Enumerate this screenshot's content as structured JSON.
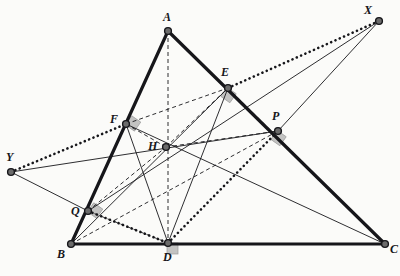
{
  "figure": {
    "background_color": "#fbfbf9",
    "stroke_color": "#16161a",
    "vertex_fill": "#6b6b6b",
    "right_angle_fill": "#b9b9b9"
  },
  "points": {
    "A": {
      "label": "A",
      "x": 168,
      "y": 31,
      "label_x": 163,
      "label_y": 11
    },
    "B": {
      "label": "B",
      "x": 71,
      "y": 244,
      "label_x": 57,
      "label_y": 248
    },
    "C": {
      "label": "C",
      "x": 385,
      "y": 244,
      "label_x": 390,
      "label_y": 243
    },
    "D": {
      "label": "D",
      "x": 168,
      "y": 243,
      "label_x": 163,
      "label_y": 251
    },
    "E": {
      "label": "E",
      "x": 228,
      "y": 88,
      "label_x": 221,
      "label_y": 66
    },
    "F": {
      "label": "F",
      "x": 126,
      "y": 124,
      "label_x": 110,
      "label_y": 113
    },
    "H": {
      "label": "H",
      "x": 166,
      "y": 147,
      "label_x": 148,
      "label_y": 140
    },
    "P": {
      "label": "P",
      "x": 278,
      "y": 131,
      "label_x": 272,
      "label_y": 110
    },
    "Q": {
      "label": "Q",
      "x": 88,
      "y": 211,
      "label_x": 71,
      "label_y": 205
    },
    "X": {
      "label": "X",
      "x": 379,
      "y": 21,
      "label_x": 364,
      "label_y": 4
    },
    "Y": {
      "label": "Y",
      "x": 11,
      "y": 172,
      "label_x": 6,
      "label_y": 151
    }
  },
  "segments": {
    "thick_solid": [
      {
        "name": "side-AB",
        "from": "A",
        "to": "B"
      },
      {
        "name": "side-BC",
        "from": "B",
        "to": "C"
      },
      {
        "name": "side-AC",
        "from": "A",
        "to": "C"
      }
    ],
    "thin_solid": [
      {
        "name": "cevian-BE",
        "from": "B",
        "to": "E"
      },
      {
        "name": "cevian-CF",
        "from": "C",
        "to": "F"
      },
      {
        "name": "segment-FD",
        "from": "F",
        "to": "D"
      },
      {
        "name": "segment-ED",
        "from": "E",
        "to": "D"
      },
      {
        "name": "segment-QY",
        "from": "Q",
        "to": "Y"
      },
      {
        "name": "segment-PX",
        "from": "P",
        "to": "X"
      },
      {
        "name": "segment-YP",
        "from": "Y",
        "to": "P"
      },
      {
        "name": "segment-QX",
        "from": "Q",
        "to": "X"
      }
    ],
    "dashed": [
      {
        "name": "altitude-AD",
        "from": "A",
        "to": "D"
      },
      {
        "name": "segment-FE",
        "from": "F",
        "to": "E"
      },
      {
        "name": "segment-QH",
        "from": "Q",
        "to": "H"
      },
      {
        "name": "segment-HP",
        "from": "H",
        "to": "P"
      },
      {
        "name": "segment-FH",
        "from": "F",
        "to": "H"
      },
      {
        "name": "segment-HE",
        "from": "H",
        "to": "E"
      },
      {
        "name": "segment-BP",
        "from": "B",
        "to": "P"
      },
      {
        "name": "segment-EC",
        "from": "E",
        "to": "C"
      },
      {
        "name": "segment-QD",
        "from": "Q",
        "to": "D"
      }
    ],
    "dotted": [
      {
        "name": "dotted-EX",
        "from": "E",
        "to": "X"
      },
      {
        "name": "dotted-YF",
        "from": "Y",
        "to": "F"
      },
      {
        "name": "dotted-QD",
        "from": "Q",
        "to": "D"
      },
      {
        "name": "dotted-DP",
        "from": "D",
        "to": "P"
      }
    ]
  },
  "right_angles": [
    {
      "name": "right-angle-at-D",
      "x": 168,
      "y": 243,
      "rotation": 0
    },
    {
      "name": "right-angle-at-E",
      "x": 228,
      "y": 88,
      "rotation": 35
    },
    {
      "name": "right-angle-at-F",
      "x": 126,
      "y": 124,
      "rotation": -55
    },
    {
      "name": "right-angle-at-P",
      "x": 278,
      "y": 131,
      "rotation": 35
    },
    {
      "name": "right-angle-at-Q",
      "x": 88,
      "y": 211,
      "rotation": -55
    }
  ],
  "vertices_marked": [
    "A",
    "B",
    "C",
    "D",
    "E",
    "F",
    "H",
    "P",
    "Q",
    "X",
    "Y"
  ]
}
